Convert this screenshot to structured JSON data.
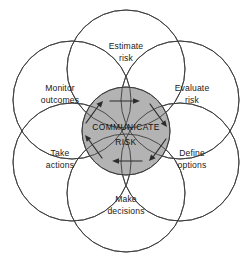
{
  "diagram": {
    "type": "venn-petal-cycle",
    "flow_direction": "clockwise",
    "colors": {
      "background": "#ffffff",
      "stroke": "#3c3c3c",
      "core_fill": "#b3b3b3",
      "arrow": "#2b2b2b",
      "text": "#1a1a1a"
    },
    "core": {
      "name": "communicate-risk",
      "line1": "COMMUNICATE",
      "line2": "RISK"
    },
    "petals": [
      {
        "id": "estimate-risk",
        "line1": "Estimate",
        "line2": "risk",
        "position": "top",
        "angle_deg": -90,
        "cx": 126,
        "cy": 69,
        "label_x": 126,
        "label_y": 49
      },
      {
        "id": "evaluate-risk",
        "line1": "Evaluate",
        "line2": "risk",
        "position": "upper-right",
        "angle_deg": -30,
        "cx": 180,
        "cy": 100,
        "label_x": 192,
        "label_y": 91
      },
      {
        "id": "define-options",
        "line1": "Define",
        "line2": "options",
        "position": "lower-right",
        "angle_deg": 30,
        "cx": 180,
        "cy": 162,
        "label_x": 192,
        "label_y": 156
      },
      {
        "id": "make-decisions",
        "line1": "Make",
        "line2": "decisions",
        "position": "bottom",
        "angle_deg": 90,
        "cx": 126,
        "cy": 193,
        "label_x": 126,
        "label_y": 202
      },
      {
        "id": "take-actions",
        "line1": "Take",
        "line2": "actions",
        "position": "lower-left",
        "angle_deg": 150,
        "cx": 72,
        "cy": 162,
        "label_x": 60,
        "label_y": 156
      },
      {
        "id": "monitor-outcomes",
        "line1": "Monitor",
        "line2": "outcomes",
        "position": "upper-left",
        "angle_deg": 210,
        "cx": 72,
        "cy": 100,
        "label_x": 60,
        "label_y": 91
      }
    ],
    "arrows": [
      {
        "id": "arrow-top",
        "position": "top",
        "points": "right"
      },
      {
        "id": "arrow-upper-right",
        "position": "upper-right",
        "points": "down-right"
      },
      {
        "id": "arrow-lower-right",
        "position": "lower-right",
        "points": "down-left"
      },
      {
        "id": "arrow-bottom",
        "position": "bottom",
        "points": "left"
      },
      {
        "id": "arrow-lower-left",
        "position": "lower-left",
        "points": "up-left"
      },
      {
        "id": "arrow-upper-left",
        "position": "upper-left",
        "points": "up-right"
      }
    ]
  }
}
